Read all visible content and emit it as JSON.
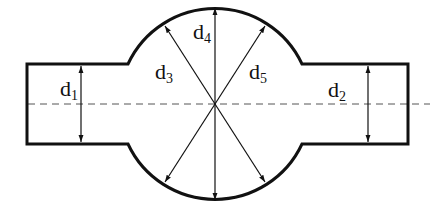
{
  "diagram": {
    "colors": {
      "stroke": "#111111",
      "centerline": "#555555",
      "background": "#ffffff"
    },
    "labels": [
      {
        "id": "d1",
        "base": "d",
        "sub": "1"
      },
      {
        "id": "d2",
        "base": "d",
        "sub": "2"
      },
      {
        "id": "d3",
        "base": "d",
        "sub": "3"
      },
      {
        "id": "d4",
        "base": "d",
        "sub": "4"
      },
      {
        "id": "d5",
        "base": "d",
        "sub": "5"
      }
    ]
  }
}
